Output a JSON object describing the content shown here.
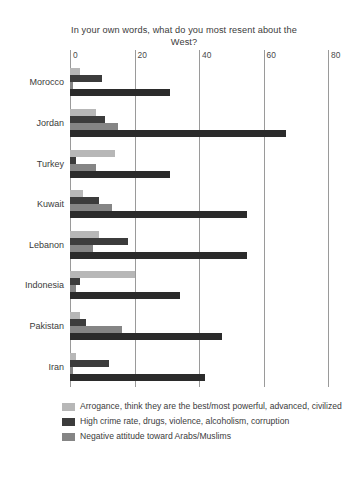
{
  "chart_data": {
    "type": "bar",
    "orientation": "horizontal",
    "title": "In your own words, what do you most resent about the West?",
    "xlabel": "",
    "ylabel": "",
    "xlim": [
      0,
      80
    ],
    "ticks": [
      0,
      20,
      40,
      60,
      80
    ],
    "grid": true,
    "legend_position": "bottom-left",
    "categories": [
      "Morocco",
      "Jordan",
      "Turkey",
      "Kuwait",
      "Lebanon",
      "Indonesia",
      "Pakistan",
      "Iran"
    ],
    "series": [
      {
        "name": "Arrogance, think they are the best/most powerful, advanced, civilized",
        "color": "#b7b7b7",
        "values": [
          3,
          8,
          14,
          4,
          9,
          20,
          3,
          2
        ]
      },
      {
        "name": "High crime rate, drugs, violence, alcoholism, corruption",
        "color": "#3c3c3c",
        "values": [
          10,
          11,
          2,
          9,
          18,
          3,
          5,
          12
        ]
      },
      {
        "name": "Negative attitude toward Arabs/Muslims",
        "color": "#858585",
        "values": [
          1,
          15,
          8,
          13,
          7,
          2,
          16,
          1
        ]
      },
      {
        "name": "",
        "color": "#2b2b2b",
        "values": [
          31,
          67,
          31,
          55,
          55,
          34,
          47,
          42
        ]
      }
    ]
  },
  "legend": {
    "items": [
      {
        "label": "Arrogance, think they are the best/most powerful, advanced, civilized",
        "color": "#b7b7b7"
      },
      {
        "label": "High crime rate, drugs, violence, alcoholism, corruption",
        "color": "#3c3c3c"
      },
      {
        "label": "Negative attitude toward Arabs/Muslims",
        "color": "#858585"
      }
    ]
  }
}
